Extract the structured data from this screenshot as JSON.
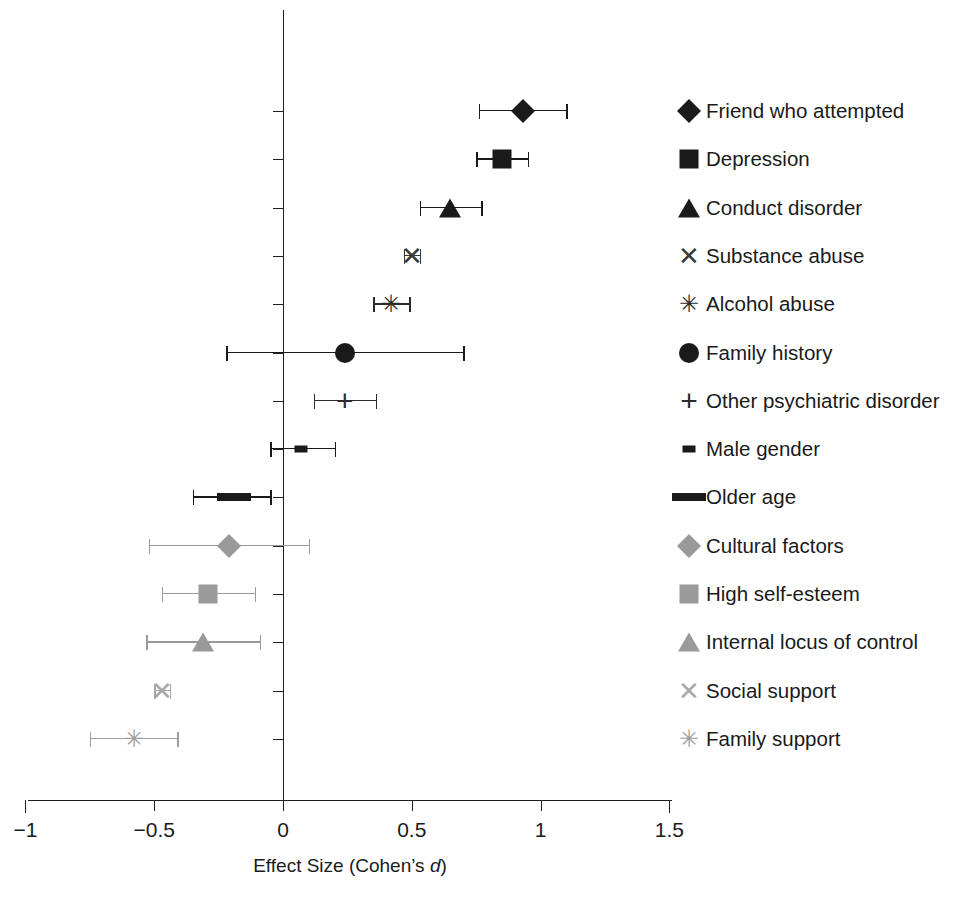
{
  "chart_data": {
    "type": "scatter",
    "title": "",
    "subtitle": "",
    "xlabel": "Effect Size (Cohen’s d)",
    "ylabel": "",
    "xlim": [
      -1,
      1.5
    ],
    "xticks": [
      -1,
      -0.5,
      0,
      0.5,
      1,
      1.5
    ],
    "xticklabels": [
      "−1",
      "−0.5",
      "0",
      "0.5",
      "1",
      "1.5"
    ],
    "grid": false,
    "reference_line": 0,
    "legend_position": "right",
    "error_bar_type": "95% confidence interval",
    "categories": [
      "Friend who attempted",
      "Depression",
      "Conduct disorder",
      "Substance abuse",
      "Alcohol abuse",
      "Family history",
      "Other psychiatric disorder",
      "Male gender",
      "Older age",
      "Cultural factors",
      "High self-esteem",
      "Internal locus of control",
      "Social support",
      "Family support"
    ],
    "values": [
      0.93,
      0.85,
      0.65,
      0.5,
      0.42,
      0.24,
      0.24,
      0.07,
      -0.19,
      -0.21,
      -0.29,
      -0.31,
      -0.47,
      -0.58
    ],
    "ci_low": [
      0.76,
      0.75,
      0.53,
      0.47,
      0.35,
      -0.22,
      0.12,
      -0.05,
      -0.35,
      -0.52,
      -0.47,
      -0.53,
      -0.5,
      -0.75
    ],
    "ci_high": [
      1.1,
      0.95,
      0.77,
      0.53,
      0.49,
      0.7,
      0.36,
      0.2,
      -0.05,
      0.1,
      -0.11,
      -0.09,
      -0.44,
      -0.41
    ],
    "points": [
      {
        "label": "Friend who attempted",
        "d": 0.93,
        "ci_low": 0.76,
        "ci_high": 1.1,
        "marker": "diamond",
        "color": "#1a1a1a"
      },
      {
        "label": "Depression",
        "d": 0.85,
        "ci_low": 0.75,
        "ci_high": 0.95,
        "marker": "square",
        "color": "#1a1a1a"
      },
      {
        "label": "Conduct disorder",
        "d": 0.65,
        "ci_low": 0.53,
        "ci_high": 0.77,
        "marker": "triangle",
        "color": "#1a1a1a"
      },
      {
        "label": "Substance abuse",
        "d": 0.5,
        "ci_low": 0.47,
        "ci_high": 0.53,
        "marker": "cross-x",
        "color": "#3a3a3a"
      },
      {
        "label": "Alcohol abuse",
        "d": 0.42,
        "ci_low": 0.35,
        "ci_high": 0.49,
        "marker": "asterisk",
        "color": "#2b2b2b"
      },
      {
        "label": "Family history",
        "d": 0.24,
        "ci_low": -0.22,
        "ci_high": 0.7,
        "marker": "circle",
        "color": "#1a1a1a"
      },
      {
        "label": "Other psychiatric disorder",
        "d": 0.24,
        "ci_low": 0.12,
        "ci_high": 0.36,
        "marker": "plus",
        "color": "#2b2b2b"
      },
      {
        "label": "Male gender",
        "d": 0.07,
        "ci_low": -0.05,
        "ci_high": 0.2,
        "marker": "dash-small",
        "color": "#1a1a1a"
      },
      {
        "label": "Older age",
        "d": -0.19,
        "ci_low": -0.35,
        "ci_high": -0.05,
        "marker": "dash-large",
        "color": "#1a1a1a"
      },
      {
        "label": "Cultural factors",
        "d": -0.21,
        "ci_low": -0.52,
        "ci_high": 0.1,
        "marker": "diamond",
        "color": "#9a9a9a"
      },
      {
        "label": "High self-esteem",
        "d": -0.29,
        "ci_low": -0.47,
        "ci_high": -0.11,
        "marker": "square",
        "color": "#9a9a9a"
      },
      {
        "label": "Internal locus of control",
        "d": -0.31,
        "ci_low": -0.53,
        "ci_high": -0.09,
        "marker": "triangle",
        "color": "#9a9a9a"
      },
      {
        "label": "Social support",
        "d": -0.47,
        "ci_low": -0.5,
        "ci_high": -0.44,
        "marker": "cross-x",
        "color": "#a8a8a8"
      },
      {
        "label": "Family support",
        "d": -0.58,
        "ci_low": -0.75,
        "ci_high": -0.41,
        "marker": "asterisk",
        "color": "#9e9e9e"
      }
    ]
  },
  "legend": {
    "items": [
      {
        "label": "Friend who attempted",
        "marker": "diamond",
        "color": "#1a1a1a"
      },
      {
        "label": "Depression",
        "marker": "square",
        "color": "#1a1a1a"
      },
      {
        "label": "Conduct disorder",
        "marker": "triangle",
        "color": "#1a1a1a"
      },
      {
        "label": "Substance abuse",
        "marker": "cross-x",
        "color": "#3a3a3a"
      },
      {
        "label": "Alcohol abuse",
        "marker": "asterisk",
        "color": "#2b2b2b"
      },
      {
        "label": "Family history",
        "marker": "circle",
        "color": "#1a1a1a"
      },
      {
        "label": "Other psychiatric disorder",
        "marker": "plus",
        "color": "#2b2b2b"
      },
      {
        "label": "Male gender",
        "marker": "dash-small",
        "color": "#1a1a1a"
      },
      {
        "label": "Older age",
        "marker": "dash-large",
        "color": "#1a1a1a"
      },
      {
        "label": "Cultural factors",
        "marker": "diamond",
        "color": "#9a9a9a"
      },
      {
        "label": "High self-esteem",
        "marker": "square",
        "color": "#9a9a9a"
      },
      {
        "label": "Internal locus of control",
        "marker": "triangle",
        "color": "#9a9a9a"
      },
      {
        "label": "Social support",
        "marker": "cross-x",
        "color": "#a8a8a8"
      },
      {
        "label": "Family support",
        "marker": "asterisk",
        "color": "#9e9e9e"
      }
    ]
  },
  "axis": {
    "title": "Effect Size (Cohen’s d)",
    "title_plain": "Effect Size (Cohen’s ",
    "title_italic": "d",
    "title_close": ")"
  },
  "colors": {
    "axis": "#1f1f1f",
    "dark_marker": "#1a1a1a",
    "light_marker": "#9a9a9a",
    "background": "#ffffff"
  }
}
